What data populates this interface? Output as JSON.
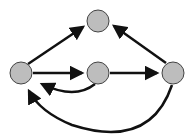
{
  "diagram": {
    "type": "directed-graph",
    "node_fill": "#bdbdbd",
    "node_stroke": "#444444",
    "edge_color": "#111111",
    "nodes": [
      {
        "id": "top",
        "cx": 98,
        "cy": 21,
        "r": 11
      },
      {
        "id": "left",
        "cx": 21,
        "cy": 73,
        "r": 11
      },
      {
        "id": "middle",
        "cx": 98,
        "cy": 73,
        "r": 11
      },
      {
        "id": "right",
        "cx": 173,
        "cy": 73,
        "r": 11
      }
    ],
    "edges": [
      {
        "from": "left",
        "to": "top",
        "shape": "straight"
      },
      {
        "from": "right",
        "to": "top",
        "shape": "straight"
      },
      {
        "from": "left",
        "to": "middle",
        "shape": "straight"
      },
      {
        "from": "middle",
        "to": "right",
        "shape": "straight"
      },
      {
        "from": "middle",
        "to": "left",
        "shape": "curved-below"
      },
      {
        "from": "right",
        "to": "left",
        "shape": "large-curve-below"
      }
    ]
  }
}
